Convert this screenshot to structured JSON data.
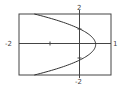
{
  "chart_data": {
    "type": "line",
    "title": "",
    "xlabel": "",
    "ylabel": "",
    "xlim": [
      -2,
      1
    ],
    "ylim": [
      -2,
      2
    ],
    "grid": false,
    "equation": "x = 1/2 - y^2/2",
    "series": [
      {
        "name": "curve",
        "x": [
          -1.5,
          -1.0,
          -0.625,
          -0.3,
          0.0,
          0.32,
          0.5,
          0.32,
          0.0,
          -0.3,
          -0.625,
          -1.0,
          -1.5
        ],
        "y": [
          2.0,
          1.732,
          1.5,
          1.265,
          1.0,
          0.6,
          0.0,
          -0.6,
          -1.0,
          -1.265,
          -1.5,
          -1.732,
          -2.0
        ]
      }
    ],
    "tick_labels": {
      "x_left": "-2",
      "x_right": "1",
      "y_top": "2",
      "y_bottom": "-2"
    },
    "colors": {
      "curve": "#333333",
      "axes": "#333333",
      "frame": "#333333"
    }
  }
}
